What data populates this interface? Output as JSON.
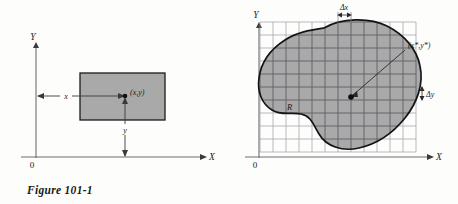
{
  "page": {
    "background_color": "#fdfdfc",
    "figure_count": 2
  },
  "figures": [
    {
      "id": "figure-101-1",
      "caption": "Figure 101-1",
      "axes": {
        "x_label": "X",
        "y_label": "Y",
        "origin_label": "0"
      },
      "shape": {
        "type": "rectangle",
        "fill_color": "#a8a8a8",
        "stroke_color": "#1b1b1b"
      },
      "annotations": {
        "point_label": "(x,y)",
        "x_distance_label": "x",
        "y_distance_label": "y"
      }
    },
    {
      "id": "figure-101-2",
      "caption": "Figure 101-2",
      "axes": {
        "x_label": "X",
        "y_label": "Y",
        "origin_label": "0"
      },
      "shape": {
        "type": "blob-region",
        "fill_color": "#a8a8a8",
        "stroke_color": "#1b1b1b"
      },
      "annotations": {
        "region_label": "R",
        "point_label": "(x*,y*)",
        "delta_x_label": "Δx",
        "delta_y_label": "Δy"
      },
      "grid": {
        "cell_size_px": 13,
        "columns": 10,
        "rows": 10,
        "line_color": "#8b8b96"
      }
    }
  ]
}
